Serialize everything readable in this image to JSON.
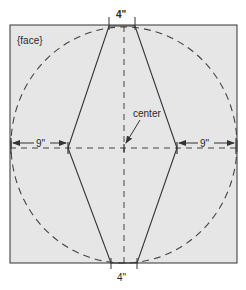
{
  "diagram": {
    "type": "pattern-template",
    "panel_label": "{face}",
    "center_label": "center",
    "top_dimension": "4\"",
    "bottom_dimension": "4\"",
    "left_dimension": "9\"",
    "right_dimension": "9\"",
    "colors": {
      "panel_fill": "#e6e6e6",
      "line": "#333333",
      "dashed": "#444444",
      "background": "#ffffff"
    },
    "shapes": {
      "panel_rect": {
        "x": 10,
        "y": 25,
        "w": 227,
        "h": 238
      },
      "circle": {
        "cx": 124,
        "cy": 145,
        "rx": 113,
        "ry": 118,
        "style": "dashed"
      },
      "hexagon_points": [
        [
          109,
          26
        ],
        [
          135,
          26
        ],
        [
          177,
          148
        ],
        [
          137,
          263
        ],
        [
          111,
          263
        ],
        [
          68,
          148
        ]
      ],
      "vertical_centerline": {
        "x": 124,
        "y1": 26,
        "y2": 263,
        "style": "dashed"
      },
      "horizontal_centerline": {
        "y": 148,
        "x1": 10,
        "x2": 237,
        "style": "dashed"
      }
    }
  }
}
